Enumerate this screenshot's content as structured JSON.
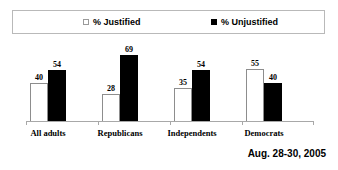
{
  "legend": {
    "items": [
      {
        "label": "% Justified",
        "marker": "open-square-icon",
        "color": "#ffffff"
      },
      {
        "label": "% Unjustified",
        "marker": "filled-square-icon",
        "color": "#000000"
      }
    ]
  },
  "footer": {
    "date": "Aug. 28-30, 2005"
  },
  "chart_data": {
    "type": "bar",
    "title": "",
    "xlabel": "",
    "ylabel": "",
    "ylim": [
      0,
      80
    ],
    "grid": false,
    "legend_position": "top",
    "categories": [
      "All adults",
      "Republicans",
      "Independents",
      "Democrats"
    ],
    "series": [
      {
        "name": "% Justified",
        "values": [
          40,
          28,
          35,
          55
        ],
        "color": "#ffffff"
      },
      {
        "name": "% Unjustified",
        "values": [
          54,
          69,
          54,
          40
        ],
        "color": "#000000"
      }
    ]
  }
}
